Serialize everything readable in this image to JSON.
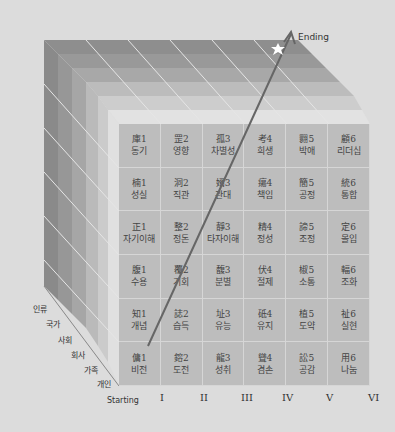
{
  "diagram": {
    "end_label": "Ending",
    "start_label": "Starting",
    "columns": [
      "I",
      "II",
      "III",
      "IV",
      "V",
      "VI"
    ],
    "layers": [
      "인류",
      "국가",
      "사회",
      "회사",
      "가족",
      "개인"
    ],
    "grid": [
      [
        {
          "h": "庫1",
          "k": "동기"
        },
        {
          "h": "罡2",
          "k": "영향"
        },
        {
          "h": "孤3",
          "k": "차별성"
        },
        {
          "h": "考4",
          "k": "희생"
        },
        {
          "h": "翾5",
          "k": "박애"
        },
        {
          "h": "顧6",
          "k": "리더십"
        }
      ],
      [
        {
          "h": "楠1",
          "k": "성실"
        },
        {
          "h": "洞2",
          "k": "직관"
        },
        {
          "h": "婿3",
          "k": "관대"
        },
        {
          "h": "瘍4",
          "k": "책임"
        },
        {
          "h": "簡5",
          "k": "공정"
        },
        {
          "h": "統6",
          "k": "통합"
        }
      ],
      [
        {
          "h": "正1",
          "k": "자기이해"
        },
        {
          "h": "整2",
          "k": "정돈"
        },
        {
          "h": "靜3",
          "k": "타자이해"
        },
        {
          "h": "精4",
          "k": "정성"
        },
        {
          "h": "諦5",
          "k": "조정"
        },
        {
          "h": "定6",
          "k": "몰입"
        }
      ],
      [
        {
          "h": "腹1",
          "k": "수용"
        },
        {
          "h": "覆2",
          "k": "기회"
        },
        {
          "h": "馥3",
          "k": "분별"
        },
        {
          "h": "伏4",
          "k": "절제"
        },
        {
          "h": "椒5",
          "k": "소통"
        },
        {
          "h": "輻6",
          "k": "조화"
        }
      ],
      [
        {
          "h": "知1",
          "k": "개념"
        },
        {
          "h": "誌2",
          "k": "습득"
        },
        {
          "h": "址3",
          "k": "유능"
        },
        {
          "h": "砥4",
          "k": "유지"
        },
        {
          "h": "植5",
          "k": "도약"
        },
        {
          "h": "祉6",
          "k": "실현"
        }
      ],
      [
        {
          "h": "傭1",
          "k": "비전"
        },
        {
          "h": "鎔2",
          "k": "도전"
        },
        {
          "h": "龍3",
          "k": "성취"
        },
        {
          "h": "聳4",
          "k": "겸손"
        },
        {
          "h": "訟5",
          "k": "공감"
        },
        {
          "h": "用6",
          "k": "나눔"
        }
      ]
    ],
    "colors": {
      "background": "#dcdcdc",
      "grid_face": "#bdbdbd",
      "arrow": "#666666",
      "star": "#ffffff"
    }
  }
}
